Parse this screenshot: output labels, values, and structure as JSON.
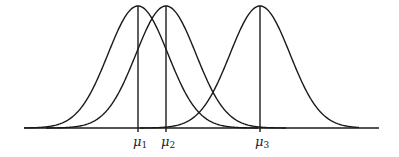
{
  "figure": {
    "axis": {
      "x_start": 24,
      "x_end": 379,
      "y": 128
    },
    "peak_y": 6,
    "sigma_px": 30,
    "stroke_color": "#1a1a1a",
    "curves": [
      {
        "name": "curve-1",
        "mean_x": 138,
        "label": "μ",
        "subscript": "1"
      },
      {
        "name": "curve-2",
        "mean_x": 166,
        "label": "μ",
        "subscript": "2"
      },
      {
        "name": "curve-3",
        "mean_x": 260,
        "label": "μ",
        "subscript": "3"
      }
    ]
  }
}
